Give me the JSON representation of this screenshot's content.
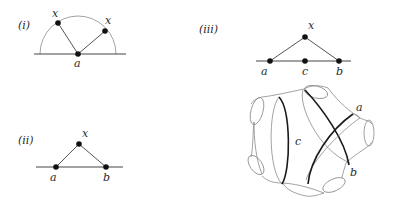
{
  "panels": [
    {
      "id": "i",
      "label": "(i)",
      "vertices": [
        {
          "name": "x",
          "role": "vertex-on-arc-left"
        },
        {
          "name": "x",
          "role": "vertex-on-arc-right"
        },
        {
          "name": "a",
          "role": "vertex-on-line"
        }
      ],
      "edges": [
        [
          "x",
          "a"
        ],
        [
          "a",
          "x"
        ]
      ],
      "shapes": [
        "semicircle",
        "baseline"
      ]
    },
    {
      "id": "ii",
      "label": "(ii)",
      "vertices": [
        {
          "name": "x",
          "role": "apex"
        },
        {
          "name": "a",
          "role": "vertex-on-line"
        },
        {
          "name": "b",
          "role": "vertex-on-line"
        }
      ],
      "edges": [
        [
          "a",
          "x"
        ],
        [
          "x",
          "b"
        ]
      ],
      "shapes": [
        "baseline"
      ]
    },
    {
      "id": "iii",
      "label": "(iii)",
      "vertices": [
        {
          "name": "x",
          "role": "apex"
        },
        {
          "name": "a",
          "role": "vertex-on-line"
        },
        {
          "name": "c",
          "role": "vertex-on-line"
        },
        {
          "name": "b",
          "role": "vertex-on-line"
        }
      ],
      "edges": [
        [
          "a",
          "x"
        ],
        [
          "x",
          "b"
        ]
      ],
      "shapes": [
        "baseline"
      ]
    }
  ],
  "surface": {
    "description": "Surface with five boundary circles and three highlighted curves",
    "curves": [
      {
        "name": "c",
        "label": "c"
      },
      {
        "name": "a",
        "label": "a"
      },
      {
        "name": "b",
        "label": "b"
      }
    ],
    "boundary_components": 5
  },
  "text": {
    "p1_label": "(i)",
    "p1_x1": "x",
    "p1_x2": "x",
    "p1_a": "a",
    "p2_label": "(ii)",
    "p2_x": "x",
    "p2_a": "a",
    "p2_b": "b",
    "p3_label": "(iii)",
    "p3_x": "x",
    "p3_a": "a",
    "p3_c": "c",
    "p3_b": "b",
    "s_c": "c",
    "s_a": "a",
    "s_b": "b"
  }
}
